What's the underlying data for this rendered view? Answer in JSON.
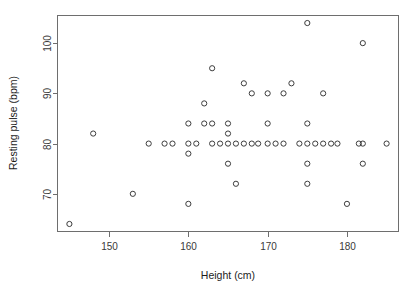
{
  "chart_data": {
    "type": "scatter",
    "title": "",
    "xlabel": "Height (cm)",
    "ylabel": "Resting pulse (bpm)",
    "xlim": [
      143.5,
      186.5
    ],
    "ylim": [
      62.5,
      105.5
    ],
    "xticks": [
      150,
      160,
      170,
      180
    ],
    "yticks": [
      70,
      80,
      90,
      100
    ],
    "grid": false,
    "legend": null,
    "marker": "open-circle",
    "marker_color": "#3d3d3d",
    "n_points": 52,
    "x": [
      145,
      148,
      153,
      155,
      157,
      158,
      160,
      160,
      160,
      160,
      161,
      162,
      162,
      163,
      163,
      163,
      164,
      165,
      165,
      165,
      165,
      166,
      166,
      167,
      167,
      168,
      168,
      170,
      170,
      170,
      171,
      172,
      172,
      173,
      174,
      175,
      175,
      175,
      175,
      175,
      175,
      176,
      177,
      177,
      178,
      178,
      180,
      181,
      182,
      182,
      182,
      185
    ],
    "y": [
      64,
      82,
      70,
      80,
      80,
      80,
      84,
      80,
      78,
      68,
      80,
      88,
      84,
      95,
      84,
      80,
      80,
      84,
      82,
      80,
      76,
      80,
      72,
      92,
      80,
      90,
      80,
      90,
      84,
      80,
      80,
      90,
      80,
      92,
      80,
      104,
      84,
      80,
      76,
      72,
      80,
      80,
      90,
      80,
      80,
      80,
      68,
      80,
      100,
      80,
      76,
      80
    ],
    "points": [
      {
        "x": 145,
        "y": 64
      },
      {
        "x": 148,
        "y": 82
      },
      {
        "x": 153,
        "y": 70
      },
      {
        "x": 155,
        "y": 80
      },
      {
        "x": 157,
        "y": 80
      },
      {
        "x": 158,
        "y": 80
      },
      {
        "x": 160,
        "y": 84
      },
      {
        "x": 160,
        "y": 80
      },
      {
        "x": 160,
        "y": 78
      },
      {
        "x": 160,
        "y": 68
      },
      {
        "x": 161,
        "y": 80
      },
      {
        "x": 162,
        "y": 88
      },
      {
        "x": 162,
        "y": 84
      },
      {
        "x": 163,
        "y": 95
      },
      {
        "x": 163,
        "y": 84
      },
      {
        "x": 163,
        "y": 80
      },
      {
        "x": 164,
        "y": 80
      },
      {
        "x": 165,
        "y": 84
      },
      {
        "x": 165,
        "y": 82
      },
      {
        "x": 165,
        "y": 80
      },
      {
        "x": 165,
        "y": 76
      },
      {
        "x": 166,
        "y": 80
      },
      {
        "x": 166,
        "y": 72
      },
      {
        "x": 167,
        "y": 92
      },
      {
        "x": 167,
        "y": 80
      },
      {
        "x": 168,
        "y": 90
      },
      {
        "x": 168,
        "y": 80
      },
      {
        "x": 170,
        "y": 90
      },
      {
        "x": 170,
        "y": 84
      },
      {
        "x": 170,
        "y": 80
      },
      {
        "x": 171,
        "y": 80
      },
      {
        "x": 172,
        "y": 90
      },
      {
        "x": 172,
        "y": 80
      },
      {
        "x": 173,
        "y": 92
      },
      {
        "x": 174,
        "y": 80
      },
      {
        "x": 175,
        "y": 104
      },
      {
        "x": 175,
        "y": 84
      },
      {
        "x": 175,
        "y": 80
      },
      {
        "x": 175,
        "y": 76
      },
      {
        "x": 175,
        "y": 72
      },
      {
        "x": 176,
        "y": 80
      },
      {
        "x": 177,
        "y": 90
      },
      {
        "x": 177,
        "y": 80
      },
      {
        "x": 178,
        "y": 80
      },
      {
        "x": 178.8,
        "y": 80
      },
      {
        "x": 180,
        "y": 68
      },
      {
        "x": 181.5,
        "y": 80
      },
      {
        "x": 182,
        "y": 100
      },
      {
        "x": 182,
        "y": 80
      },
      {
        "x": 182,
        "y": 76
      },
      {
        "x": 185,
        "y": 80
      },
      {
        "x": 168.8,
        "y": 80
      }
    ]
  },
  "axes": {
    "x_title": "Height (cm)",
    "y_title": "Resting pulse (bpm)",
    "x_tick_labels": [
      "150",
      "160",
      "170",
      "180"
    ],
    "y_tick_labels": [
      "70",
      "80",
      "90",
      "100"
    ]
  }
}
